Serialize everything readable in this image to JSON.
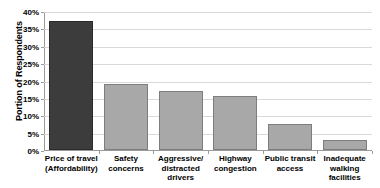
{
  "chart_data": {
    "type": "bar",
    "title": "",
    "subtitle": "",
    "xlabel": "",
    "ylabel": "Portion of Respondents",
    "categories": [
      "Price of travel (Affordability)",
      "Safety concerns",
      "Aggressive/ distracted drivers",
      "Highway congestion",
      "Public transit access",
      "Inadequate walking facilities"
    ],
    "category_lines": [
      [
        "Price of travel",
        "(Affordability)"
      ],
      [
        "Safety",
        "concerns"
      ],
      [
        "Aggressive/",
        "distracted",
        "drivers"
      ],
      [
        "Highway",
        "congestion"
      ],
      [
        "Public transit",
        "access"
      ],
      [
        "Inadequate",
        "walking",
        "facilities"
      ]
    ],
    "values": [
      37,
      19,
      17,
      15.5,
      7.5,
      3
    ],
    "value_unit": "%",
    "ylim": [
      0,
      40
    ],
    "ytick_values": [
      0,
      5,
      10,
      15,
      20,
      25,
      30,
      35,
      40
    ],
    "ytick_labels": [
      "0%",
      "5%",
      "10%",
      "15%",
      "20%",
      "25%",
      "30%",
      "35%",
      "40%"
    ],
    "grid": true,
    "grid_axis": "y",
    "legend": false,
    "legend_position": "none",
    "bar_colors": [
      "#3c3c3c",
      "#a8a8a8",
      "#a8a8a8",
      "#a8a8a8",
      "#a8a8a8",
      "#a8a8a8"
    ],
    "bar_border_colors": [
      "#2b2b2b",
      "#7d7d7d",
      "#7d7d7d",
      "#7d7d7d",
      "#7d7d7d",
      "#7d7d7d"
    ],
    "highlight_color": "#3c3c3c",
    "series_color": "#a8a8a8",
    "axis_color": "#9a9a9a",
    "grid_color": "#d9d9d9",
    "text_color": "#000000",
    "background_color": "#ffffff"
  }
}
